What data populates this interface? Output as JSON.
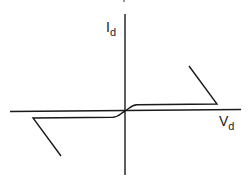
{
  "diagram": {
    "type": "current-voltage characteristic",
    "y_axis": {
      "label_main": "I",
      "label_sub": "d"
    },
    "x_axis": {
      "label_main": "V",
      "label_sub": "d"
    },
    "colors": {
      "background": "#ffffff",
      "stroke": "#1a1a1a"
    },
    "curves": [
      {
        "name": "positive-branch",
        "description": "rises from origin, flat plateau, then steep breakdown back toward upper-left",
        "points": [
          [
            125,
            111
          ],
          [
            131,
            107
          ],
          [
            137,
            105
          ],
          [
            217,
            104
          ],
          [
            189,
            66
          ]
        ]
      },
      {
        "name": "negative-branch",
        "description": "falls from origin, flat plateau, then steep breakdown toward lower-right",
        "points": [
          [
            125,
            111
          ],
          [
            119,
            115
          ],
          [
            113,
            117
          ],
          [
            33,
            118
          ],
          [
            61,
            156
          ]
        ]
      }
    ]
  }
}
